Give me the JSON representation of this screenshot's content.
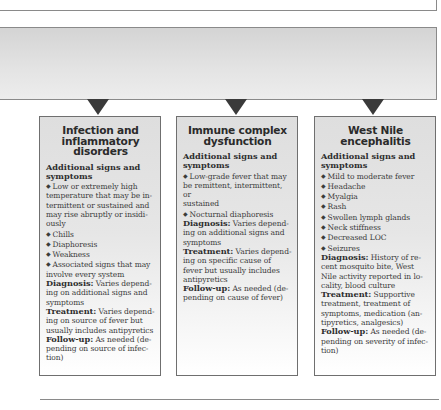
{
  "cards": [
    {
      "title_lines": [
        "Infection and",
        "inflammatory",
        "disorders"
      ],
      "section_heading_lines": [
        "Additional signs and",
        "symptoms"
      ],
      "bullets": [
        [
          "Low or extremely high",
          "temperature that may be in-",
          "termittent or sustained and",
          "may rise abruptly or insidi-",
          "ously"
        ],
        [
          "Chills"
        ],
        [
          "Diaphoresis"
        ],
        [
          "Weakness"
        ],
        [
          "Associated signs that may",
          "involve every system"
        ]
      ],
      "diagnosis_label": "Diagnosis:",
      "diagnosis_lines": [
        " Varies depend-",
        "ing on additional signs and",
        "symptoms"
      ],
      "treatment_label": "Treatment:",
      "treatment_lines": [
        " Varies depend-",
        "ing on source of fever but",
        "usually includes antipyretics"
      ],
      "followup_label": "Follow-up:",
      "followup_lines": [
        " As needed (de-",
        "pending on source of infec-",
        "tion)"
      ]
    },
    {
      "title_lines": [
        "Immune complex",
        "dysfunction"
      ],
      "section_heading_lines": [
        "Additional signs and",
        "symptoms"
      ],
      "bullets": [
        [
          "Low-grade fever that may",
          "be remittent, intermittent, or",
          "sustained"
        ],
        [
          "Nocturnal diaphoresis"
        ]
      ],
      "diagnosis_label": "Diagnosis:",
      "diagnosis_lines": [
        " Varies depend-",
        "ing on additional signs and",
        "symptoms"
      ],
      "treatment_label": "Treatment:",
      "treatment_lines": [
        " Varies depend-",
        "ing on specific cause of",
        "fever but usually includes",
        "antipyretics"
      ],
      "followup_label": "Follow-up:",
      "followup_lines": [
        " As needed (de-",
        "pending on cause of fever)"
      ]
    },
    {
      "title_lines": [
        "West Nile",
        "encephalitis"
      ],
      "section_heading_lines": [
        "Additional signs and",
        "symptoms"
      ],
      "bullets": [
        [
          "Mild to moderate fever"
        ],
        [
          "Headache"
        ],
        [
          "Myalgia"
        ],
        [
          "Rash"
        ],
        [
          "Swollen lymph glands"
        ],
        [
          "Neck stiffness"
        ],
        [
          "Decreased LOC"
        ],
        [
          "Seizures"
        ]
      ],
      "diagnosis_label": "Diagnosis:",
      "diagnosis_lines": [
        " History of re-",
        "cent mosquito bite, West",
        "Nile activity reported in lo-",
        "cality, blood culture"
      ],
      "treatment_label": "Treatment:",
      "treatment_lines": [
        " Supportive",
        "treatment, treatment of",
        "symptoms, medication (an-",
        "tipyretics, analgesics)"
      ],
      "followup_label": "Follow-up:",
      "followup_lines": [
        " As needed (de-",
        "pending on severity of infec-",
        "tion)"
      ]
    }
  ],
  "bullet_glyph": "◆"
}
